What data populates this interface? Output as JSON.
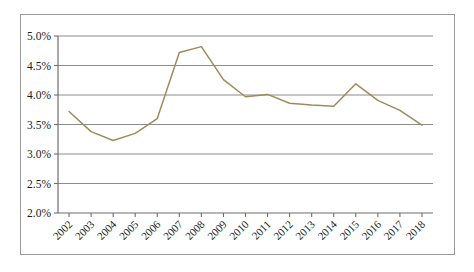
{
  "chart_data": {
    "type": "line",
    "title": "",
    "subtitle": "",
    "xlabel": "",
    "ylabel": "",
    "categories": [
      "2002",
      "2003",
      "2004",
      "2005",
      "2006",
      "2007",
      "2008",
      "2009",
      "2010",
      "2011",
      "2012",
      "2013",
      "2014",
      "2015",
      "2016",
      "2017",
      "2018"
    ],
    "values": [
      3.72,
      3.38,
      3.23,
      3.35,
      3.6,
      4.72,
      4.82,
      4.26,
      3.97,
      4.01,
      3.86,
      3.83,
      3.81,
      4.19,
      3.91,
      3.74,
      3.49
    ],
    "series": [
      {
        "name": "",
        "values": [
          3.72,
          3.38,
          3.23,
          3.35,
          3.6,
          4.72,
          4.82,
          4.26,
          3.97,
          4.01,
          3.86,
          3.83,
          3.81,
          4.19,
          3.91,
          3.74,
          3.49
        ]
      }
    ],
    "ylim": [
      2.0,
      5.0
    ],
    "ytick_values": [
      2.0,
      2.5,
      3.0,
      3.5,
      4.0,
      4.5,
      5.0
    ],
    "ytick_labels": [
      "2.0%",
      "2.5%",
      "3.0%",
      "3.5%",
      "4.0%",
      "4.5%",
      "5.0%"
    ],
    "xtick_labels": [
      "2002",
      "2003",
      "2004",
      "2005",
      "2006",
      "2007",
      "2008",
      "2009",
      "2010",
      "2011",
      "2012",
      "2013",
      "2014",
      "2015",
      "2016",
      "2017",
      "2018"
    ],
    "grid": true,
    "grid_axis": "y",
    "legend": false,
    "legend_position": "none",
    "annotations": [],
    "colors": {
      "line": "#a08a5a",
      "grid": "#8c8c8c",
      "axis": "#6e6e6e",
      "border": "#9a9a9a",
      "background": "#ffffff",
      "text": "#1c1c1c"
    },
    "xtick_label_rotation": -45
  }
}
